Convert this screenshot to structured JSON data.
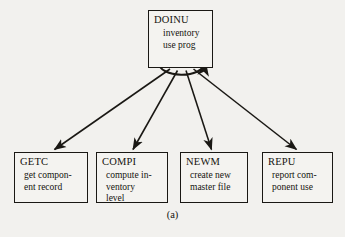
{
  "figure": {
    "caption": "(a)",
    "background_color": "#f2f1ee",
    "line_color": "#1a1814"
  },
  "root_module": {
    "name": "DOINU",
    "description": "inventory\nuse prog",
    "iteration_marker": "iteration-arc"
  },
  "child_modules": [
    {
      "name": "GETC",
      "description": "get compon-\nent record"
    },
    {
      "name": "COMPI",
      "description": "compute in-\nventory\nlevel"
    },
    {
      "name": "NEWM",
      "description": "create new\nmaster file"
    },
    {
      "name": "REPU",
      "description": "report com-\nponent use"
    }
  ],
  "connectors": [
    {
      "label": "call-getc"
    },
    {
      "label": "call-compi"
    },
    {
      "label": "call-newm"
    },
    {
      "label": "call-repu"
    }
  ]
}
